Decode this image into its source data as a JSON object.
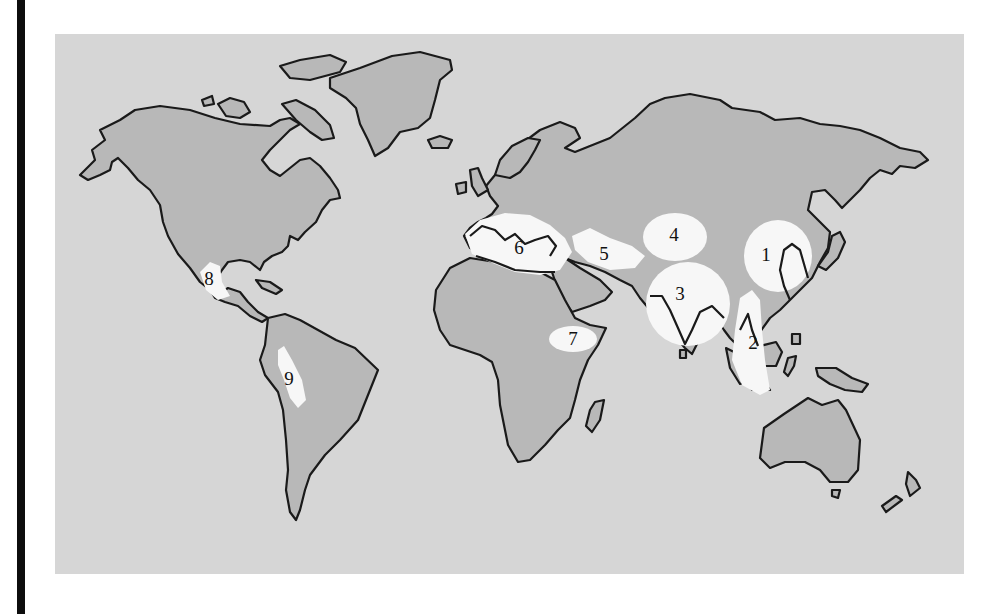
{
  "map": {
    "colors": {
      "ocean": "#d6d6d6",
      "land": "#b8b8b8",
      "center_region": "#f7f7f7",
      "outline": "#1a1a1a",
      "left_bar": "#0d0d0d"
    },
    "centers": [
      {
        "id": "1",
        "label": "1",
        "x": 766,
        "y": 256
      },
      {
        "id": "2",
        "label": "2",
        "x": 753,
        "y": 345
      },
      {
        "id": "3",
        "label": "3",
        "x": 680,
        "y": 295
      },
      {
        "id": "4",
        "label": "4",
        "x": 674,
        "y": 237
      },
      {
        "id": "5",
        "label": "5",
        "x": 604,
        "y": 256
      },
      {
        "id": "6",
        "label": "6",
        "x": 519,
        "y": 250
      },
      {
        "id": "7",
        "label": "7",
        "x": 573,
        "y": 340
      },
      {
        "id": "8",
        "label": "8",
        "x": 209,
        "y": 280
      },
      {
        "id": "9",
        "label": "9",
        "x": 289,
        "y": 380
      }
    ]
  }
}
